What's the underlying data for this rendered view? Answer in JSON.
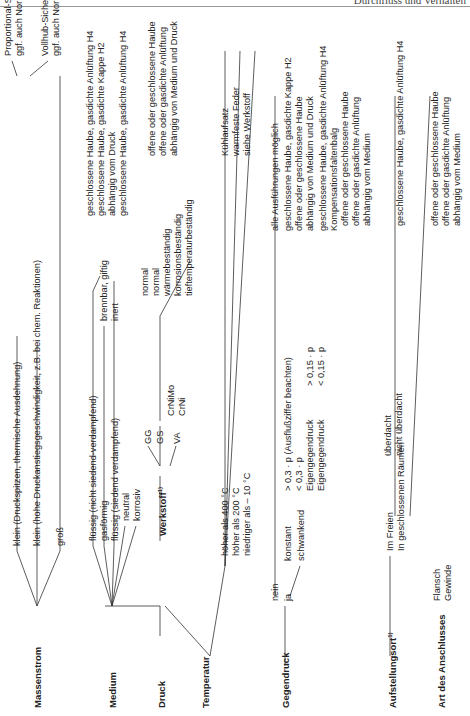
{
  "header": {
    "title": "Durchfluss und Verhalten"
  },
  "tree": {
    "massenstrom": {
      "label": "Massenstrom",
      "options": [
        "klein (Druckspitzen, thermische Ausdehnung)",
        "klein (hohe Druckanstiegsgeschwindigkeit, z.B. bei chem. Reaktionen)",
        "groß"
      ],
      "results": [
        [
          "Proportional-Sicherheitsventil",
          "ggf. auch Normal-Sicherheitsventil"
        ],
        [
          "Vollhub-Sicherheitsventil",
          "ggf. auch Normal-Sicherheitsventil"
        ]
      ]
    },
    "medium": {
      "label": "Medium",
      "options": [
        "flüssig (nicht siedend-verdampfend)",
        "gasförmig",
        "flüssig (siedend verdampfend)",
        "neutral",
        "korrosiv"
      ],
      "sub": [
        "brennbar, giftig",
        "inert"
      ],
      "results": [
        "geschlossene Haube, gasdichte Anlüftung H4",
        "geschlossene Haube, gasdichte Kappe H2",
        "abhängig vom Druck",
        "geschlossene Haube, gasdichte Anlüftung H4"
      ]
    },
    "werkstoff": {
      "label": "Werkstoff",
      "footnote": "1)",
      "materials": [
        "GG",
        "GS",
        "VA"
      ],
      "va_sub": [
        "CrNiMo",
        "CrNi"
      ],
      "properties": [
        "normal",
        "normal",
        "wärmebeständig",
        "korrosionsbeständig",
        "tieftemperaturbeständig"
      ],
      "results": [
        "offene oder geschlossene Haube",
        "offene oder gasdichte Anlüftung",
        "abhängig von Medium und Druck"
      ]
    },
    "druck": {
      "label": "Druck"
    },
    "temperatur": {
      "label": "Temperatur",
      "options": [
        "höher als 400 °C",
        "höher als 200 °C",
        "niedriger als – 10 °C"
      ],
      "results": [
        "Kühlaufsatz",
        "warmfeste Feder",
        "siehe Werkstoff"
      ]
    },
    "gegendruck": {
      "label": "Gegendruck",
      "options": [
        "nein",
        "ja"
      ],
      "ja_sub": [
        "konstant",
        "schwankend"
      ],
      "konstant_sub": [
        "> 0,3 · p (Ausflußziffer beachten)",
        "< 0,3 · p"
      ],
      "schwankend_sub": [
        "Eigengegendruck",
        "Eigengegendruck"
      ],
      "eigen_sub": [
        "> 0,15 · p",
        "< 0,15 · p"
      ],
      "results": [
        "alle Ausführungen möglich",
        "geschlossene Haube, gasdichte Kappe H2",
        "offene oder geschlossene Haube",
        "abhängig von Medium und Druck",
        "geschlossene Haube, gasdichte Anlüftung H4",
        "Kompensationsfaltenbalg"
      ]
    },
    "aufstellungsort": {
      "label": "Aufstellungsort",
      "footnote": "1)",
      "options": [
        "Im Freien",
        "In geschlossenen Räumen"
      ],
      "freien_sub": [
        "überdacht",
        "nicht überdacht"
      ],
      "results": [
        "offene oder geschlossene Haube",
        "offene oder gasdichte Anlüftung",
        "abhängig vom Medium",
        "geschlossene Haube, gasdichte Anlüftung H4"
      ]
    },
    "anschluss": {
      "label": "Art des Anschlusses",
      "options": [
        "Flansch",
        "Gewinde"
      ],
      "results": [
        "offene oder geschlossene Haube",
        "offene oder gasdichte Anlüftung",
        "abhängig vom Medium"
      ]
    }
  }
}
